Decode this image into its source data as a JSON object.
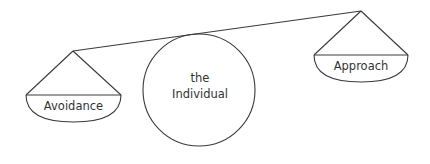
{
  "diagram": {
    "type": "balance-scale",
    "colors": {
      "stroke": "#3a3a3a",
      "text": "#333333",
      "background": "#ffffff"
    },
    "left_pan": {
      "label": "Avoidance"
    },
    "right_pan": {
      "label": "Approach"
    },
    "fulcrum": {
      "line1": "the",
      "line2": "Individual"
    }
  }
}
